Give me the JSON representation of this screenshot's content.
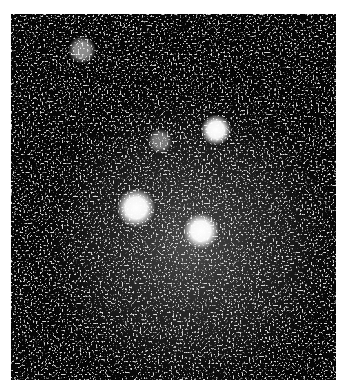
{
  "image": {
    "description": "Grainy monochrome astronomical-style image of a diffuse glowing cloud with bright point sources",
    "frame": {
      "x": 11,
      "y": 14,
      "width": 325,
      "height": 366
    },
    "background_color": "#050505",
    "glow_color": "#9a9a9a",
    "bright_spots": [
      {
        "name": "spot-top-left-faint",
        "cx": 71,
        "cy": 36,
        "r": 10,
        "intensity": 0.55
      },
      {
        "name": "spot-upper-right",
        "cx": 205,
        "cy": 116,
        "r": 11,
        "intensity": 1.0
      },
      {
        "name": "spot-upper-middle-dim",
        "cx": 149,
        "cy": 127,
        "r": 9,
        "intensity": 0.45
      },
      {
        "name": "spot-center-left",
        "cx": 125,
        "cy": 194,
        "r": 14,
        "intensity": 1.0
      },
      {
        "name": "spot-center-right",
        "cx": 190,
        "cy": 217,
        "r": 13,
        "intensity": 1.0
      }
    ],
    "cloud": {
      "cx": 180,
      "cy": 230,
      "rx": 170,
      "ry": 170
    }
  }
}
